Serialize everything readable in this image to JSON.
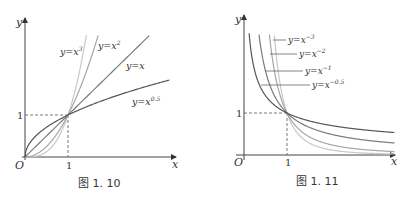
{
  "figures": [
    {
      "caption": "图 1. 10",
      "axis_labels": {
        "x": "x",
        "y": "y",
        "origin": "O",
        "x_tick": "1",
        "y_tick": "1"
      },
      "curves": [
        {
          "label_base": "y=x",
          "label_exp": "3",
          "exponent": 3,
          "color": "#c8c8c8"
        },
        {
          "label_base": "y=x",
          "label_exp": "2",
          "exponent": 2,
          "color": "#a6a6a6"
        },
        {
          "label_base": "y=x",
          "label_exp": "",
          "exponent": 1,
          "color": "#7a7a7a"
        },
        {
          "label_base": "y=x",
          "label_exp": "0.5",
          "exponent": 0.5,
          "color": "#555555"
        }
      ]
    },
    {
      "caption": "图 1. 11",
      "axis_labels": {
        "x": "x",
        "y": "y",
        "origin": "O",
        "x_tick": "1",
        "y_tick": "1"
      },
      "curves": [
        {
          "label_base": "y=x",
          "label_exp": "−3",
          "exponent": -3,
          "color": "#c8c8c8"
        },
        {
          "label_base": "y=x",
          "label_exp": "−2",
          "exponent": -2,
          "color": "#a6a6a6"
        },
        {
          "label_base": "y=x",
          "label_exp": "−1",
          "exponent": -1,
          "color": "#7a7a7a"
        },
        {
          "label_base": "y=x",
          "label_exp": "−0.5",
          "exponent": -0.5,
          "color": "#555555"
        }
      ]
    }
  ]
}
